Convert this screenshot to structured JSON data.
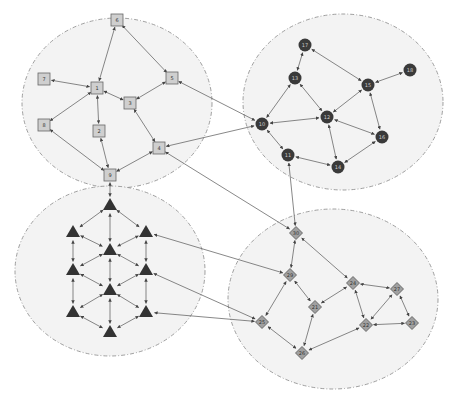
{
  "diagram": {
    "type": "clustered-network-graph",
    "colors": {
      "cluster_fill": "#f3f3f3",
      "cluster_stroke": "#888888",
      "edge": "#555555",
      "square_fill": "#cfcfcf",
      "square_stroke": "#666666",
      "circle_fill": "#3a3a3a",
      "triangle_fill": "#333333",
      "diamond_fill": "#a0a0a0",
      "diamond_stroke": "#555555",
      "label_dark": "#333333",
      "label_light": "#cccccc"
    },
    "clusters": [
      {
        "id": "A",
        "shape": "square",
        "cx": 117,
        "cy": 103,
        "rx": 95,
        "ry": 85
      },
      {
        "id": "B",
        "shape": "circle",
        "cx": 343,
        "cy": 102,
        "rx": 100,
        "ry": 88
      },
      {
        "id": "C",
        "shape": "triangle",
        "cx": 110,
        "cy": 271,
        "rx": 95,
        "ry": 85
      },
      {
        "id": "D",
        "shape": "diamond",
        "cx": 333,
        "cy": 299,
        "rx": 105,
        "ry": 90
      }
    ],
    "nodes": [
      {
        "id": "s6",
        "label": "6",
        "shape": "square",
        "x": 117,
        "y": 20
      },
      {
        "id": "s7",
        "label": "7",
        "shape": "square",
        "x": 44,
        "y": 79
      },
      {
        "id": "s1",
        "label": "1",
        "shape": "square",
        "x": 97,
        "y": 88
      },
      {
        "id": "s5",
        "label": "5",
        "shape": "square",
        "x": 172,
        "y": 78
      },
      {
        "id": "s3",
        "label": "3",
        "shape": "square",
        "x": 130,
        "y": 103
      },
      {
        "id": "s8",
        "label": "8",
        "shape": "square",
        "x": 44,
        "y": 125
      },
      {
        "id": "s2",
        "label": "2",
        "shape": "square",
        "x": 99,
        "y": 131
      },
      {
        "id": "s4",
        "label": "4",
        "shape": "square",
        "x": 159,
        "y": 148
      },
      {
        "id": "s9",
        "label": "9",
        "shape": "square",
        "x": 110,
        "y": 175
      },
      {
        "id": "c17",
        "label": "17",
        "shape": "circle",
        "x": 305,
        "y": 45
      },
      {
        "id": "c13",
        "label": "13",
        "shape": "circle",
        "x": 295,
        "y": 78
      },
      {
        "id": "c15",
        "label": "15",
        "shape": "circle",
        "x": 368,
        "y": 85
      },
      {
        "id": "c18",
        "label": "18",
        "shape": "circle",
        "x": 410,
        "y": 70
      },
      {
        "id": "c12",
        "label": "12",
        "shape": "circle",
        "x": 327,
        "y": 117
      },
      {
        "id": "c10",
        "label": "10",
        "shape": "circle",
        "x": 262,
        "y": 124
      },
      {
        "id": "c11",
        "label": "11",
        "shape": "circle",
        "x": 288,
        "y": 155
      },
      {
        "id": "c14",
        "label": "14",
        "shape": "circle",
        "x": 338,
        "y": 167
      },
      {
        "id": "c16",
        "label": "16",
        "shape": "circle",
        "x": 382,
        "y": 137
      },
      {
        "id": "t0",
        "label": "",
        "shape": "triangle",
        "x": 110,
        "y": 205
      },
      {
        "id": "t1",
        "label": "",
        "shape": "triangle",
        "x": 73,
        "y": 232
      },
      {
        "id": "t2",
        "label": "",
        "shape": "triangle",
        "x": 146,
        "y": 232
      },
      {
        "id": "t3",
        "label": "",
        "shape": "triangle",
        "x": 110,
        "y": 250
      },
      {
        "id": "t4",
        "label": "",
        "shape": "triangle",
        "x": 73,
        "y": 270
      },
      {
        "id": "t5",
        "label": "",
        "shape": "triangle",
        "x": 146,
        "y": 270
      },
      {
        "id": "t6",
        "label": "",
        "shape": "triangle",
        "x": 110,
        "y": 290
      },
      {
        "id": "t7",
        "label": "",
        "shape": "triangle",
        "x": 73,
        "y": 312
      },
      {
        "id": "t8",
        "label": "",
        "shape": "triangle",
        "x": 146,
        "y": 312
      },
      {
        "id": "t9",
        "label": "",
        "shape": "triangle",
        "x": 110,
        "y": 332
      },
      {
        "id": "d30",
        "label": "30",
        "shape": "diamond",
        "x": 296,
        "y": 233
      },
      {
        "id": "d29",
        "label": "29",
        "shape": "diamond",
        "x": 290,
        "y": 275
      },
      {
        "id": "d24",
        "label": "24",
        "shape": "diamond",
        "x": 353,
        "y": 283
      },
      {
        "id": "d27",
        "label": "27",
        "shape": "diamond",
        "x": 397,
        "y": 289
      },
      {
        "id": "d21",
        "label": "21",
        "shape": "diamond",
        "x": 315,
        "y": 307
      },
      {
        "id": "d25",
        "label": "25",
        "shape": "diamond",
        "x": 262,
        "y": 322
      },
      {
        "id": "d22",
        "label": "22",
        "shape": "diamond",
        "x": 366,
        "y": 325
      },
      {
        "id": "d23",
        "label": "23",
        "shape": "diamond",
        "x": 412,
        "y": 323
      },
      {
        "id": "d26",
        "label": "26",
        "shape": "diamond",
        "x": 302,
        "y": 353
      }
    ],
    "edges": [
      [
        "s6",
        "s1"
      ],
      [
        "s6",
        "s5"
      ],
      [
        "s7",
        "s1"
      ],
      [
        "s1",
        "s3"
      ],
      [
        "s1",
        "s2"
      ],
      [
        "s1",
        "s8"
      ],
      [
        "s5",
        "s3"
      ],
      [
        "s3",
        "s4"
      ],
      [
        "s8",
        "s9"
      ],
      [
        "s2",
        "s9"
      ],
      [
        "s4",
        "s9"
      ],
      [
        "c17",
        "c13"
      ],
      [
        "c17",
        "c15"
      ],
      [
        "c15",
        "c18"
      ],
      [
        "c13",
        "c10"
      ],
      [
        "c13",
        "c12"
      ],
      [
        "c15",
        "c12"
      ],
      [
        "c15",
        "c16"
      ],
      [
        "c10",
        "c12"
      ],
      [
        "c12",
        "c16"
      ],
      [
        "c12",
        "c14"
      ],
      [
        "c10",
        "c11"
      ],
      [
        "c11",
        "c14"
      ],
      [
        "c14",
        "c16"
      ],
      [
        "t0",
        "t1"
      ],
      [
        "t0",
        "t2"
      ],
      [
        "t0",
        "t3"
      ],
      [
        "t1",
        "t3"
      ],
      [
        "t2",
        "t3"
      ],
      [
        "t1",
        "t4"
      ],
      [
        "t2",
        "t5"
      ],
      [
        "t3",
        "t4"
      ],
      [
        "t3",
        "t5"
      ],
      [
        "t3",
        "t6"
      ],
      [
        "t4",
        "t6"
      ],
      [
        "t5",
        "t6"
      ],
      [
        "t4",
        "t7"
      ],
      [
        "t5",
        "t8"
      ],
      [
        "t6",
        "t7"
      ],
      [
        "t6",
        "t8"
      ],
      [
        "t6",
        "t9"
      ],
      [
        "t7",
        "t9"
      ],
      [
        "t8",
        "t9"
      ],
      [
        "d30",
        "d29"
      ],
      [
        "d30",
        "d24"
      ],
      [
        "d29",
        "d25"
      ],
      [
        "d29",
        "d21"
      ],
      [
        "d24",
        "d21"
      ],
      [
        "d24",
        "d27"
      ],
      [
        "d24",
        "d22"
      ],
      [
        "d27",
        "d22"
      ],
      [
        "d27",
        "d23"
      ],
      [
        "d22",
        "d23"
      ],
      [
        "d21",
        "d26"
      ],
      [
        "d25",
        "d26"
      ],
      [
        "d26",
        "d22"
      ],
      [
        "s5",
        "c10"
      ],
      [
        "s4",
        "c10"
      ],
      [
        "s4",
        "d30"
      ],
      [
        "s9",
        "t0"
      ],
      [
        "c11",
        "d30"
      ],
      [
        "t2",
        "d29"
      ],
      [
        "t5",
        "d25"
      ],
      [
        "t8",
        "d25"
      ]
    ]
  }
}
